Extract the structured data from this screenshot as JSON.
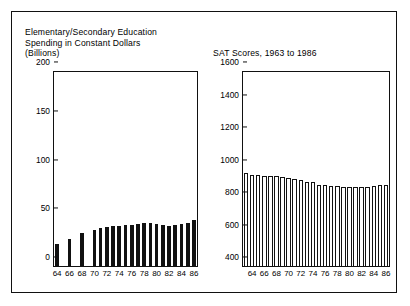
{
  "figure": {
    "border_color": "#111111",
    "background": "#ffffff"
  },
  "chart_data": [
    {
      "type": "bar",
      "id": "education-spending",
      "title": "Elementary/Secondary Education\nSpending in Constant Dollars\n(Billions)",
      "xlabel": "",
      "ylabel": "",
      "ylim": [
        0,
        200
      ],
      "yticks": [
        0,
        50,
        100,
        150,
        200
      ],
      "ytick_labels": [
        "0",
        "50",
        "100",
        "150",
        "200"
      ],
      "grid": false,
      "legend": "none",
      "bar_style": "solid-black",
      "bar_color": "#111111",
      "categories": [
        "64",
        "65",
        "66",
        "67",
        "68",
        "69",
        "70",
        "71",
        "72",
        "73",
        "74",
        "75",
        "76",
        "77",
        "78",
        "79",
        "80",
        "81",
        "82",
        "83",
        "84",
        "85",
        "86"
      ],
      "xtick_labels": [
        "64",
        "66",
        "68",
        "70",
        "72",
        "74",
        "76",
        "78",
        "80",
        "82",
        "84",
        "86"
      ],
      "values": [
        24,
        null,
        29,
        null,
        35,
        null,
        38,
        40,
        41,
        42,
        42,
        43,
        43,
        44,
        45,
        45,
        44,
        43,
        42,
        43,
        44,
        45,
        48
      ]
    },
    {
      "type": "bar",
      "id": "sat-scores",
      "title": "SAT Scores, 1963 to 1986",
      "xlabel": "",
      "ylabel": "",
      "ylim": [
        400,
        1600
      ],
      "yticks": [
        400,
        600,
        800,
        1000,
        1200,
        1400,
        1600
      ],
      "ytick_labels": [
        "400",
        "600",
        "800",
        "1000",
        "1200",
        "1400",
        "1600"
      ],
      "grid": false,
      "legend": "none",
      "bar_style": "hollow-outlined",
      "bar_color": "#ffffff",
      "bar_edge_color": "#111111",
      "categories": [
        "63",
        "64",
        "65",
        "66",
        "67",
        "68",
        "69",
        "70",
        "71",
        "72",
        "73",
        "74",
        "75",
        "76",
        "77",
        "78",
        "79",
        "80",
        "81",
        "82",
        "83",
        "84",
        "85",
        "86"
      ],
      "xtick_labels": [
        "64",
        "66",
        "68",
        "70",
        "72",
        "74",
        "76",
        "78",
        "80",
        "82",
        "84",
        "86"
      ],
      "values": [
        980,
        969,
        969,
        958,
        958,
        958,
        956,
        948,
        943,
        937,
        926,
        924,
        906,
        903,
        899,
        897,
        894,
        890,
        890,
        893,
        893,
        897,
        906,
        906
      ]
    }
  ]
}
